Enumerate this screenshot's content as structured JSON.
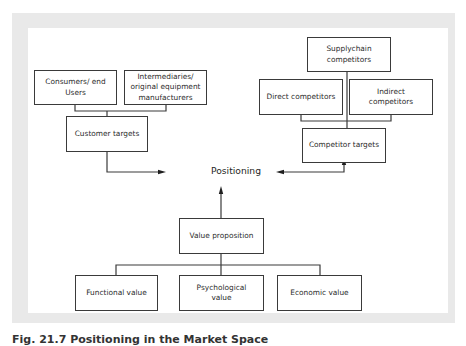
{
  "diagram": {
    "boxes": {
      "consumers": "Consumers/ end\nUsers",
      "intermediaries": "Intermediaries/\noriginal equipment\nmanufacturers",
      "customer_targets": "Customer targets",
      "supplychain": "Supplychain\ncompetitors",
      "direct": "Direct competitors",
      "indirect": "Indirect\ncompetitors",
      "competitor_targets": "Competitor targets",
      "value_proposition": "Value proposition",
      "functional": "Functional value",
      "psychological": "Psychological\nvalue",
      "economic": "Economic value"
    },
    "center_label": "Positioning",
    "colors": {
      "line": "#3a3a3a",
      "frame": "#e9e9e9",
      "background": "#ffffff"
    }
  },
  "caption": "Fig. 21.7 Positioning in the Market Space"
}
